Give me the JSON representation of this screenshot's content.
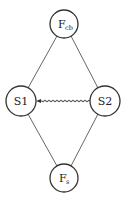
{
  "diagram": {
    "type": "graph",
    "nodes": [
      {
        "id": "fcb",
        "label": "F",
        "subscript": "cb",
        "cx": 64,
        "cy": 24,
        "r": 14
      },
      {
        "id": "s1",
        "label": "S1",
        "subscript": "",
        "cx": 21,
        "cy": 101,
        "r": 15
      },
      {
        "id": "s2",
        "label": "S2",
        "subscript": "",
        "cx": 105,
        "cy": 101,
        "r": 15
      },
      {
        "id": "fs",
        "label": "F",
        "subscript": "s",
        "cx": 64,
        "cy": 178,
        "r": 14
      }
    ],
    "edges": [
      {
        "from": "fcb",
        "to": "s1",
        "style": "straight"
      },
      {
        "from": "fcb",
        "to": "s2",
        "style": "straight"
      },
      {
        "from": "fs",
        "to": "s1",
        "style": "straight"
      },
      {
        "from": "fs",
        "to": "s2",
        "style": "straight"
      },
      {
        "from": "s2",
        "to": "s1",
        "style": "wavy-arrow"
      }
    ],
    "colors": {
      "stroke": "#333333",
      "text": "#222222",
      "background": "#ffffff"
    }
  }
}
